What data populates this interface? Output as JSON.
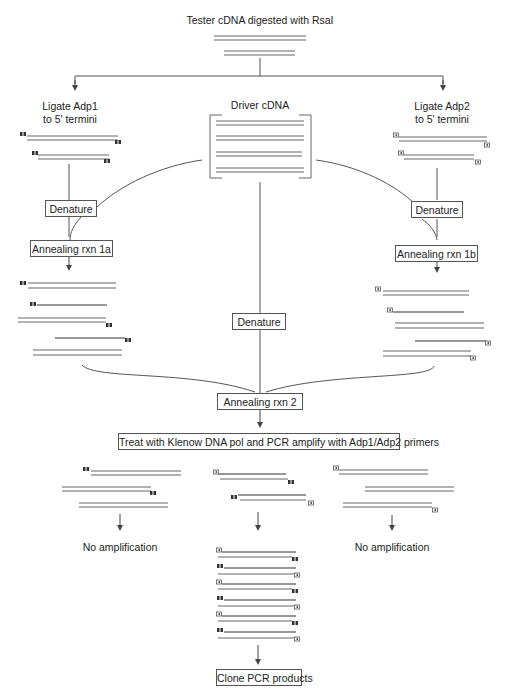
{
  "title": "Tester cDNA digested with RsaI",
  "left_branch": {
    "label_line1": "Ligate Adp1",
    "label_line2": "to 5' termini"
  },
  "center_branch": {
    "label": "Driver cDNA"
  },
  "right_branch": {
    "label_line1": "Ligate Adp2",
    "label_line2": "to 5' termini"
  },
  "steps": {
    "denature_left": "Denature",
    "denature_right": "Denature",
    "denature_center": "Denature",
    "anneal_1a": "Annealing rxn 1a",
    "anneal_1b": "Annealing rxn 1b",
    "anneal_2": "Annealing rxn 2",
    "klenow_pcr": "Treat with Klenow DNA pol and PCR amplify with Adp1/Adp2 primers",
    "clone": "Clone PCR products"
  },
  "outcomes": {
    "left": "No amplification",
    "right": "No amplification"
  },
  "adapters": {
    "adp1": {
      "glyph": "filled-double-square",
      "color": "#333333"
    },
    "adp2": {
      "glyph": "open-square",
      "color": "#555555"
    }
  },
  "colors": {
    "line": "#555555",
    "strand": "#666666",
    "box_border": "#555555"
  }
}
